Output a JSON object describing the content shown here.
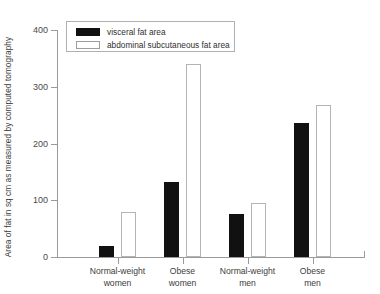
{
  "chart_data": {
    "type": "bar",
    "title": "",
    "xlabel": "",
    "ylabel": "Area of fat in sq cm as measured by computed tomography",
    "categories": [
      "Normal-weight\nwomen",
      "Obese\nwomen",
      "Normal-weight\nmen",
      "Obese\nmen"
    ],
    "series": [
      {
        "name": "visceral fat area",
        "values": [
          20,
          132,
          76,
          236
        ],
        "style": "filled",
        "color": "#111111"
      },
      {
        "name": "abdominal subcutaneous fat area",
        "values": [
          80,
          340,
          95,
          268
        ],
        "style": "open",
        "color": "#ffffff"
      }
    ],
    "ylim": [
      0,
      400
    ],
    "yticks": [
      0,
      100,
      200,
      300,
      400
    ],
    "ytick_labels": [
      "0",
      "100",
      "200",
      "300",
      "400"
    ],
    "grid": false,
    "legend_position": "top-left"
  },
  "legend": {
    "items": [
      {
        "label": "visceral fat area",
        "style": "filled"
      },
      {
        "label": "abdominal subcutaneous fat area",
        "style": "open"
      }
    ]
  }
}
